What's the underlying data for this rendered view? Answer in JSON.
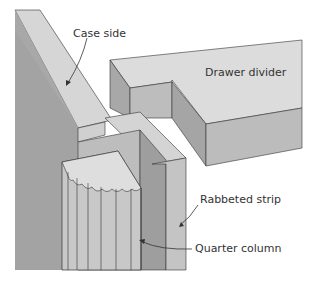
{
  "diagram": {
    "labels": {
      "case_side": "Case side",
      "drawer_divider": "Drawer divider",
      "rabbeted_strip": "Rabbeted strip",
      "quarter_column": "Quarter column"
    },
    "colors": {
      "top_face": "#d9d9d9",
      "side_face": "#b3b3b3",
      "dark_face": "#9e9e9e",
      "outline": "#333333"
    }
  }
}
